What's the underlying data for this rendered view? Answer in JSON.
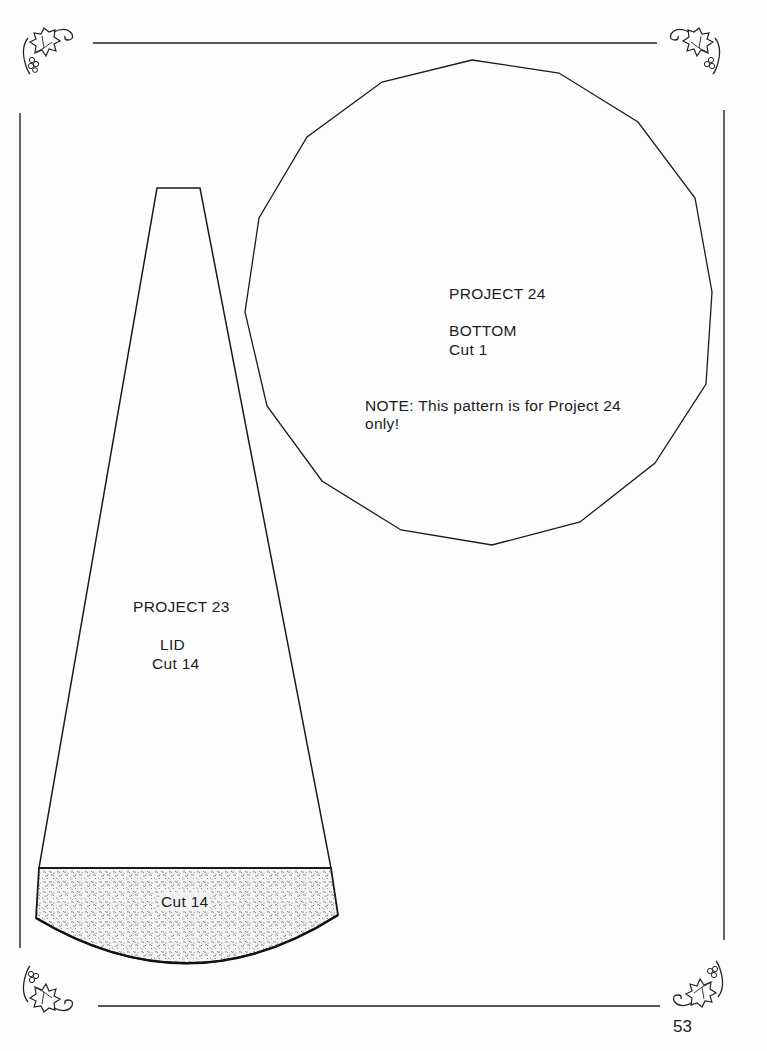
{
  "page": {
    "number": "53",
    "ink_color": "#1a1a1a",
    "paper_color": "#fdfdfd"
  },
  "patterns": {
    "project24": {
      "title": "PROJECT 24",
      "piece": "BOTTOM",
      "cut": "Cut 1",
      "note_line1": "NOTE: This pattern is for Project 24",
      "note_line2": "only!",
      "shape": "16-sided polygon"
    },
    "project23": {
      "title": "PROJECT 23",
      "piece": "LID",
      "cut": "Cut 14",
      "band_cut": "Cut 14",
      "shape": "tapered wedge with stippled curved base band"
    }
  },
  "decorations": {
    "corners": [
      "grape-vine-ornament-top-left",
      "grape-vine-ornament-top-right",
      "grape-vine-ornament-bottom-left",
      "grape-vine-ornament-bottom-right"
    ]
  }
}
